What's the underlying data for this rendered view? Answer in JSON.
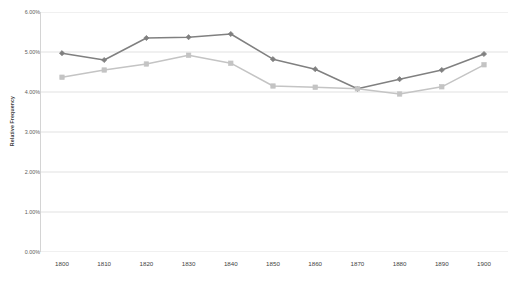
{
  "chart_data": {
    "type": "line",
    "title": "",
    "subtitle": "",
    "xlabel": "",
    "ylabel": "Relative Frequency",
    "x": [
      1800,
      1810,
      1820,
      1830,
      1840,
      1850,
      1860,
      1870,
      1880,
      1890,
      1900
    ],
    "x_tick_labels": [
      "1800",
      "1810",
      "1820",
      "1830",
      "1840",
      "1850",
      "1860",
      "1870",
      "1880",
      "1890",
      "1900"
    ],
    "y_tick_labels": [
      "0.00%",
      "1.00%",
      "2.00%",
      "3.00%",
      "4.00%",
      "5.00%",
      "6.00%"
    ],
    "y_tick_values": [
      0.0,
      1.0,
      2.0,
      3.0,
      4.0,
      5.0,
      6.0
    ],
    "ylim": [
      0.0,
      6.0
    ],
    "xlim": [
      1800,
      1900
    ],
    "grid": "horizontal",
    "legend": "none",
    "series": [
      {
        "name": "series-1",
        "color": "#808080",
        "marker": "diamond",
        "values": [
          4.97,
          4.8,
          5.35,
          5.37,
          5.45,
          4.82,
          4.57,
          4.08,
          4.32,
          4.55,
          4.95
        ]
      },
      {
        "name": "series-2",
        "color": "#c4c4c4",
        "marker": "square",
        "values": [
          4.37,
          4.55,
          4.7,
          4.92,
          4.72,
          4.15,
          4.12,
          4.08,
          3.95,
          4.13,
          4.68
        ]
      }
    ]
  }
}
